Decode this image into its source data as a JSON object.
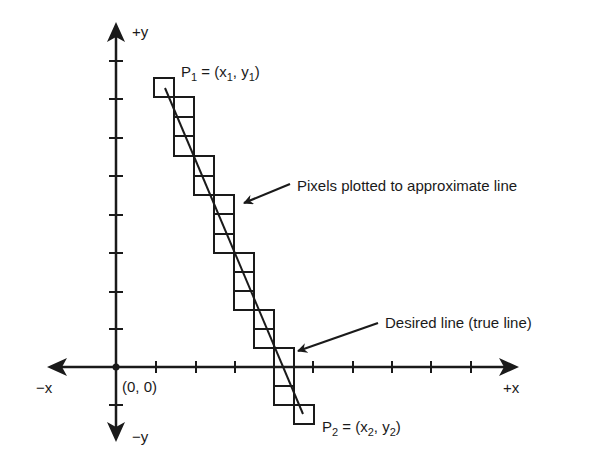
{
  "diagram": {
    "colors": {
      "ink": "#1a1a1a",
      "background": "#ffffff"
    },
    "axes": {
      "origin_label": "(0, 0)",
      "pos_x_label": "+x",
      "neg_x_label": "−x",
      "pos_y_label": "+y",
      "neg_y_label": "−y",
      "x_ticks_positive": 10,
      "y_ticks_positive": 8,
      "y_ticks_negative": 1
    },
    "endpoints": {
      "p1": {
        "name": "P",
        "sub": "1",
        "eq": " = (x",
        "xsub": "1",
        "mid": ", y",
        "ysub": "1",
        "close": ")"
      },
      "p2": {
        "name": "P",
        "sub": "2",
        "eq": " = (x",
        "xsub": "2",
        "mid": ", y",
        "ysub": "2",
        "close": ")"
      }
    },
    "annotations": {
      "pixels": "Pixels plotted to approximate line",
      "true_line": "Desired line (true line)"
    },
    "pixel_columns": [
      {
        "col": 0,
        "count": 1
      },
      {
        "col": 1,
        "count": 3
      },
      {
        "col": 2,
        "count": 2
      },
      {
        "col": 3,
        "count": 3
      },
      {
        "col": 4,
        "count": 3
      },
      {
        "col": 5,
        "count": 2
      },
      {
        "col": 6,
        "count": 3
      },
      {
        "col": 7,
        "count": 1
      }
    ]
  }
}
